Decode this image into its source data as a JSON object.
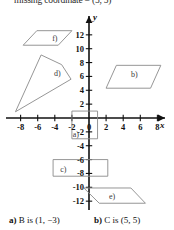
{
  "header": {
    "text": "missing coordinate = (5, 5)"
  },
  "graph": {
    "axes": {
      "x_name": "x",
      "y_name": "y",
      "x_ticks": [
        "-8",
        "-6",
        "-4",
        "-2",
        "0",
        "2",
        "4",
        "6",
        "8"
      ],
      "y_ticks_positive": [
        "12",
        "10",
        "8",
        "6",
        "4",
        "2"
      ],
      "y_ticks_negative": [
        "-2",
        "-4",
        "-6",
        "-8",
        "-10",
        "-12"
      ],
      "xlim": [
        -9,
        9
      ],
      "ylim": [
        -13,
        13
      ],
      "origin_label": "0"
    },
    "shapes": [
      {
        "label": "a)",
        "type": "rectangle",
        "points": "-2,1 1,1 1,-3 -2,-3"
      },
      {
        "label": "b)",
        "type": "parallelogram",
        "points": "3.2,7.6 8.4,7.6 7.2,4.3 2.0,4.3"
      },
      {
        "label": "c)",
        "type": "rectangle",
        "points": "-4.2,-6 2.2,-6 2.2,-8.4 -4.2,-8.4"
      },
      {
        "label": "d)",
        "type": "quadrilateral",
        "points": "-5.6,9.1 -3.2,7.7 -2.1,5.6 -8.6,0.9"
      },
      {
        "label": "e)",
        "type": "parallelogram",
        "points": "-0.6,-10.1 4.9,-10.1 6.6,-12.3 1.2,-12.3"
      },
      {
        "label": "f)",
        "type": "parallelogram",
        "points": "-6.1,12.6 -2.0,12.6 -3.6,10.5 -7.7,10.5"
      }
    ],
    "colors": {
      "axis": "#111111",
      "shape_stroke": "#8a8a8a",
      "label_text": "#3a3a3a"
    }
  },
  "answers": [
    {
      "key": "a)",
      "text": "B is (1, −3)"
    },
    {
      "key": "b)",
      "text": "C is (5, 5)"
    }
  ]
}
